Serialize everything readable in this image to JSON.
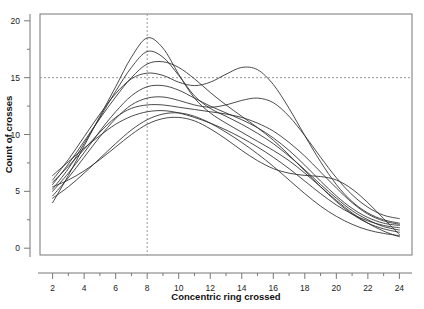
{
  "chart_data": {
    "type": "line",
    "title": "",
    "xlabel": "Concentric ring crossed",
    "ylabel": "Count of crosses",
    "xlim": [
      1.2,
      24.8
    ],
    "ylim": [
      -0.6,
      20.6
    ],
    "xticks": [
      2,
      4,
      6,
      8,
      10,
      12,
      14,
      16,
      18,
      20,
      22,
      24
    ],
    "yticks": [
      0,
      5,
      10,
      15,
      20
    ],
    "xtick_labels": [
      "2",
      "4",
      "6",
      "8",
      "10",
      "12",
      "14",
      "16",
      "18",
      "20",
      "22",
      "24"
    ],
    "ytick_labels": [
      "0",
      "5",
      "10",
      "15",
      "20"
    ],
    "x_minor_ticks": [
      3,
      5,
      7,
      9,
      11,
      13,
      15,
      17,
      19,
      21,
      23
    ],
    "y_minor_ticks": [
      2.5,
      7.5,
      12.5,
      17.5
    ],
    "grid": false,
    "legend": "none",
    "reference_lines": [
      {
        "orientation": "horizontal",
        "value": 15,
        "style": "dashed"
      },
      {
        "orientation": "vertical",
        "value": 8,
        "style": "dashed"
      }
    ],
    "line_color": "#2b2b2b",
    "x": [
      2,
      3,
      4,
      5,
      6,
      7,
      8,
      9,
      10,
      11,
      12,
      13,
      14,
      15,
      16,
      17,
      18,
      19,
      20,
      21,
      22,
      23,
      24
    ],
    "series": [
      {
        "name": "subject-1",
        "values": [
          4.0,
          6.4,
          9.0,
          11.6,
          14.2,
          16.8,
          18.5,
          17.6,
          15.3,
          13.2,
          11.9,
          11.0,
          10.2,
          9.4,
          8.6,
          7.7,
          6.6,
          5.4,
          4.2,
          3.1,
          2.2,
          1.5,
          1.0
        ]
      },
      {
        "name": "subject-2",
        "values": [
          5.2,
          7.0,
          9.2,
          11.5,
          13.8,
          15.9,
          17.3,
          16.8,
          15.2,
          13.4,
          12.3,
          11.6,
          10.9,
          10.1,
          9.2,
          8.1,
          6.9,
          5.6,
          4.4,
          3.3,
          2.5,
          1.9,
          1.6
        ]
      },
      {
        "name": "subject-3",
        "values": [
          5.6,
          7.4,
          9.4,
          11.4,
          13.3,
          15.0,
          16.2,
          16.4,
          15.9,
          14.9,
          13.7,
          12.6,
          11.6,
          10.6,
          9.5,
          8.2,
          6.8,
          5.4,
          4.1,
          3.0,
          2.2,
          1.7,
          1.4
        ]
      },
      {
        "name": "subject-4",
        "values": [
          6.0,
          7.8,
          9.8,
          11.8,
          13.6,
          14.9,
          15.4,
          15.2,
          14.6,
          14.3,
          14.6,
          15.3,
          15.9,
          15.7,
          14.4,
          12.3,
          9.9,
          7.6,
          5.6,
          4.1,
          3.1,
          2.5,
          2.2
        ]
      },
      {
        "name": "subject-5",
        "values": [
          5.0,
          6.6,
          8.4,
          10.3,
          12.0,
          13.4,
          14.2,
          14.3,
          13.9,
          13.2,
          12.5,
          11.9,
          11.3,
          10.6,
          9.7,
          8.6,
          7.3,
          5.9,
          4.6,
          3.5,
          2.7,
          2.2,
          2.0
        ]
      },
      {
        "name": "subject-6",
        "values": [
          4.6,
          6.2,
          8.0,
          9.8,
          11.4,
          12.6,
          13.2,
          13.3,
          13.0,
          12.6,
          12.4,
          12.6,
          13.0,
          13.2,
          12.8,
          11.6,
          9.9,
          8.0,
          6.2,
          4.7,
          3.6,
          2.9,
          2.6
        ]
      },
      {
        "name": "subject-7",
        "values": [
          5.8,
          7.2,
          8.7,
          10.2,
          11.5,
          12.3,
          12.6,
          12.6,
          12.4,
          12.2,
          12.0,
          11.8,
          11.5,
          11.0,
          10.3,
          9.3,
          8.1,
          6.7,
          5.3,
          4.0,
          3.0,
          2.4,
          2.1
        ]
      },
      {
        "name": "subject-8",
        "values": [
          6.4,
          7.6,
          8.8,
          9.9,
          10.9,
          11.6,
          12.0,
          12.1,
          11.9,
          11.5,
          11.0,
          10.4,
          9.7,
          8.9,
          8.0,
          7.0,
          5.9,
          4.8,
          3.8,
          3.0,
          2.4,
          2.0,
          1.8
        ]
      },
      {
        "name": "subject-9",
        "values": [
          4.4,
          5.4,
          6.6,
          7.9,
          9.2,
          10.4,
          11.3,
          11.8,
          11.9,
          11.6,
          11.0,
          10.2,
          9.3,
          8.3,
          7.2,
          6.0,
          4.8,
          3.7,
          2.8,
          2.1,
          1.6,
          1.3,
          1.1
        ]
      },
      {
        "name": "subject-10",
        "values": [
          5.4,
          6.0,
          6.8,
          7.8,
          8.9,
          10.0,
          10.9,
          11.4,
          11.5,
          11.2,
          10.5,
          9.6,
          8.6,
          7.7,
          7.0,
          6.6,
          6.4,
          6.3,
          6.0,
          5.2,
          4.0,
          2.6,
          1.2
        ]
      }
    ]
  }
}
